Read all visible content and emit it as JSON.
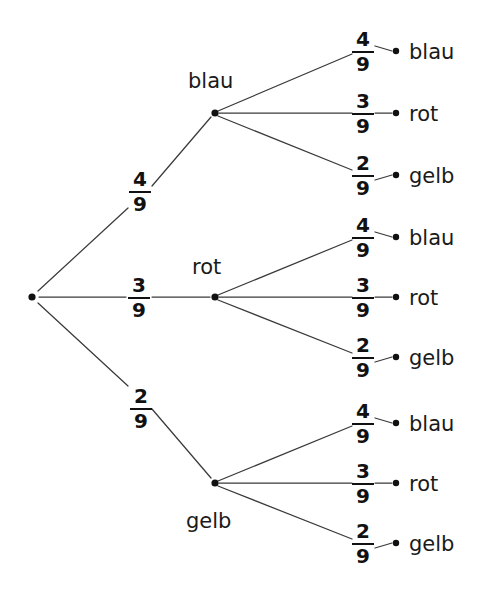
{
  "diagram": {
    "type": "probability-tree",
    "title": "",
    "root": {
      "label": ""
    },
    "colors": {
      "line": "#3a3a3a",
      "dot": "#111111",
      "text": "#1a1a1a",
      "background": "#ffffff"
    },
    "level1": [
      {
        "id": "b1",
        "label": "blau",
        "fraction": {
          "numerator": "4",
          "denominator": "9"
        }
      },
      {
        "id": "b2",
        "label": "rot",
        "fraction": {
          "numerator": "3",
          "denominator": "9"
        }
      },
      {
        "id": "b3",
        "label": "gelb",
        "fraction": {
          "numerator": "2",
          "denominator": "9"
        }
      }
    ],
    "level2": [
      {
        "parent": "b1",
        "leaves": [
          {
            "label": "blau",
            "fraction": {
              "numerator": "4",
              "denominator": "9"
            }
          },
          {
            "label": "rot",
            "fraction": {
              "numerator": "3",
              "denominator": "9"
            }
          },
          {
            "label": "gelb",
            "fraction": {
              "numerator": "2",
              "denominator": "9"
            }
          }
        ]
      },
      {
        "parent": "b2",
        "leaves": [
          {
            "label": "blau",
            "fraction": {
              "numerator": "4",
              "denominator": "9"
            }
          },
          {
            "label": "rot",
            "fraction": {
              "numerator": "3",
              "denominator": "9"
            }
          },
          {
            "label": "gelb",
            "fraction": {
              "numerator": "2",
              "denominator": "9"
            }
          }
        ]
      },
      {
        "parent": "b3",
        "leaves": [
          {
            "label": "blau",
            "fraction": {
              "numerator": "4",
              "denominator": "9"
            }
          },
          {
            "label": "rot",
            "fraction": {
              "numerator": "3",
              "denominator": "9"
            }
          },
          {
            "label": "gelb",
            "fraction": {
              "numerator": "2",
              "denominator": "9"
            }
          }
        ]
      }
    ]
  }
}
